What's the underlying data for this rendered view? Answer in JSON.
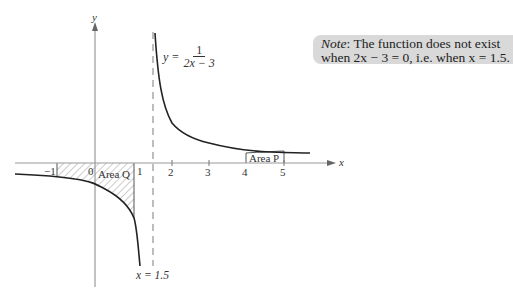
{
  "diagram": {
    "type": "function-graph",
    "function": {
      "lhs": "y =",
      "numerator": "1",
      "denominator": "2x − 3"
    },
    "axes": {
      "x_label": "x",
      "y_label": "y",
      "x_ticks": [
        "−1",
        "0",
        "1",
        "2",
        "3",
        "4",
        "5"
      ]
    },
    "asymptote": {
      "label": "x = 1.5",
      "value": 1.5
    },
    "areas": [
      {
        "label": "Area Q",
        "from": -1,
        "to": 1,
        "style": "hatched"
      },
      {
        "label": "Area P",
        "from": 4,
        "to": 5,
        "style": "outlined"
      }
    ],
    "note": {
      "prefix": "Note",
      "line1": ": The function does not exist",
      "line2": "when 2x − 3 = 0, i.e. when x = 1.5."
    },
    "colors": {
      "curve": "#222222",
      "axis": "#999999",
      "note_bg": "#d9d9d9",
      "hatch": "#999999"
    }
  }
}
